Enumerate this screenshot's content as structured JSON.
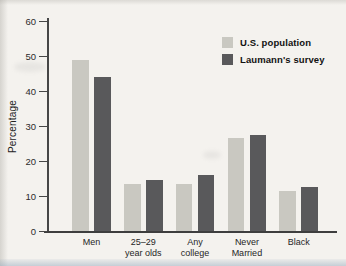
{
  "figure": {
    "background_color": "#f4f2ee",
    "axis_color": "#464646"
  },
  "chart_data": {
    "type": "bar",
    "title": "",
    "xlabel": "",
    "ylabel": "Percentage",
    "ylim": [
      0,
      60
    ],
    "yticks": [
      0,
      10,
      20,
      30,
      40,
      50,
      60
    ],
    "grid": false,
    "legend_position": "top-right",
    "categories": [
      "Men",
      "25–29 year olds",
      "Any college",
      "Never Married",
      "Black"
    ],
    "category_label_lines": [
      [
        "Men"
      ],
      [
        "25–29",
        "year olds"
      ],
      [
        "Any",
        "college"
      ],
      [
        "Never",
        "Married"
      ],
      [
        "Black"
      ]
    ],
    "series": [
      {
        "name": "U.S. population",
        "color": "#c9c8c1",
        "values": [
          49,
          13.5,
          13.5,
          26.5,
          11.5
        ]
      },
      {
        "name": "Laumann's survey",
        "color": "#59595b",
        "values": [
          44,
          14.5,
          16,
          27.5,
          12.5
        ]
      }
    ]
  }
}
